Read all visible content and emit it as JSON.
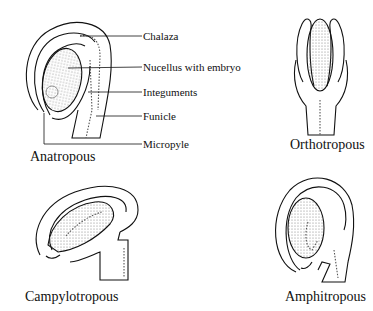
{
  "diagram": {
    "type": "ovule-types",
    "panels": [
      {
        "name": "Anatropous",
        "caption": "Anatropous"
      },
      {
        "name": "Orthotropous",
        "caption": "Orthotropous"
      },
      {
        "name": "Campylotropous",
        "caption": "Campylotropous"
      },
      {
        "name": "Amphitropous",
        "caption": "Amphitropous"
      }
    ],
    "anatropous_labels": {
      "chalaza": "Chalaza",
      "nucellus": "Nucellus with embryo",
      "integuments": "Integuments",
      "funicle": "Funicle",
      "micropyle": "Micropyle"
    },
    "colors": {
      "line": "#111111",
      "background": "#ffffff",
      "stipple": "#555555"
    }
  }
}
